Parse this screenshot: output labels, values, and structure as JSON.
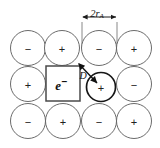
{
  "figure": {
    "caption_label": "F-center in ionic lattice",
    "background_color": "#ffffff",
    "ink_color": "#1d1d1d",
    "lattice_line_color": "#5a5a5a"
  },
  "lattice": {
    "rows": 3,
    "columns": 4,
    "circle_diameter_px": 35,
    "ions": [
      {
        "id": "ion-r0c0",
        "row": 0,
        "col": 0,
        "sign": "−",
        "cx": 28,
        "cy": 48,
        "r": 17.5,
        "bold": false
      },
      {
        "id": "ion-r0c1",
        "row": 0,
        "col": 1,
        "sign": "+",
        "cx": 62,
        "cy": 48,
        "r": 17.5,
        "bold": false
      },
      {
        "id": "ion-r0c2",
        "row": 0,
        "col": 2,
        "sign": "−",
        "cx": 99,
        "cy": 48,
        "r": 17.5,
        "bold": false
      },
      {
        "id": "ion-r0c3",
        "row": 0,
        "col": 3,
        "sign": "+",
        "cx": 134,
        "cy": 48,
        "r": 17.5,
        "bold": false
      },
      {
        "id": "ion-r1c0",
        "row": 1,
        "col": 0,
        "sign": "+",
        "cx": 28,
        "cy": 84,
        "r": 17.5,
        "bold": false
      },
      {
        "id": "ion-r1c2",
        "row": 1,
        "col": 2,
        "sign": "+",
        "cx": 101,
        "cy": 87,
        "r": 14.5,
        "bold": true
      },
      {
        "id": "ion-r1c3",
        "row": 1,
        "col": 3,
        "sign": "−",
        "cx": 134,
        "cy": 84,
        "r": 17.5,
        "bold": false
      },
      {
        "id": "ion-r2c0",
        "row": 2,
        "col": 0,
        "sign": "−",
        "cx": 28,
        "cy": 121,
        "r": 17.5,
        "bold": false
      },
      {
        "id": "ion-r2c1",
        "row": 2,
        "col": 1,
        "sign": "+",
        "cx": 63,
        "cy": 121,
        "r": 17.5,
        "bold": false
      },
      {
        "id": "ion-r2c2",
        "row": 2,
        "col": 2,
        "sign": "−",
        "cx": 99,
        "cy": 121,
        "r": 17.5,
        "bold": false
      },
      {
        "id": "ion-r2c3",
        "row": 2,
        "col": 3,
        "sign": "+",
        "cx": 134,
        "cy": 121,
        "r": 17.5,
        "bold": false
      }
    ]
  },
  "vacancy": {
    "id": "vacancy-box",
    "label": "e",
    "charge_superscript": "−",
    "full_label": "e−",
    "x": 46,
    "y": 66,
    "width": 34,
    "height": 35
  },
  "dimension": {
    "id": "radius-dimension",
    "label_main": "2r",
    "label_sub": "A",
    "full_label": "2rₐ",
    "line_y": 17,
    "x_start": 82,
    "x_end": 117,
    "extension_top": 22,
    "extension_bottom": 48
  },
  "distance_annotation": {
    "id": "distance-D",
    "label": "D",
    "from_x": 79,
    "from_y": 64,
    "to_x": 97,
    "to_y": 83,
    "label_x": 83,
    "label_y": 75
  }
}
